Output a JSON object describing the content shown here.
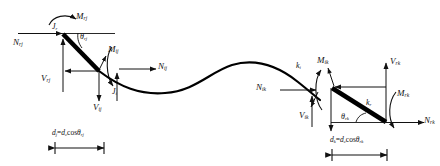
{
  "figure": {
    "type": "engineering-free-body-diagram",
    "stroke_color": "#111111",
    "member_color": "#000000",
    "background": "#ffffff",
    "width": 440,
    "height": 166
  },
  "left_joint": {
    "moment_top_label": "M",
    "moment_top_sub": "rj",
    "node_r_label": "J",
    "node_r_sub": "r",
    "axial_label": "N",
    "axial_sub": "rj",
    "shear_left_label": "V",
    "shear_left_sub": "rj",
    "angle_label": "θ",
    "angle_sub": "rj",
    "moment_inner_label": "M",
    "moment_inner_sub": "ij",
    "axial_inner_label": "N",
    "axial_inner_sub": "ij",
    "shear_down_label": "V",
    "shear_down_sub": "ij",
    "node_i_label": "J",
    "node_i_sub": "i",
    "dimension": {
      "symbol": "d",
      "symbol_sub": "j",
      "equals": "=",
      "expr_symbol": "d",
      "expr_sub": "c",
      "expr_func": "cos",
      "expr_angle": "θ",
      "expr_angle_sub": "rj",
      "full_text": "dj=dccosθrj"
    }
  },
  "right_joint": {
    "node_i_label": "k",
    "node_i_sub": "i",
    "moment_inner_label": "M",
    "moment_inner_sub": "ik",
    "axial_inner_label": "N",
    "axial_inner_sub": "ik",
    "shear_inner_label": "V",
    "shear_inner_sub": "ik",
    "angle_label": "θ",
    "angle_sub": "rk",
    "node_r_label": "k",
    "node_r_sub": "r",
    "shear_up_label": "V",
    "shear_up_sub": "rk",
    "moment_right_label": "M",
    "moment_right_sub": "rk",
    "axial_right_label": "N",
    "axial_right_sub": "rk",
    "dimension": {
      "symbol": "d",
      "symbol_sub": "k",
      "equals": "=",
      "expr_symbol": "d",
      "expr_sub": "c",
      "expr_func": "cos",
      "expr_angle": "θ",
      "expr_angle_sub": "rk",
      "full_text": "dk=dccosθrk"
    }
  }
}
